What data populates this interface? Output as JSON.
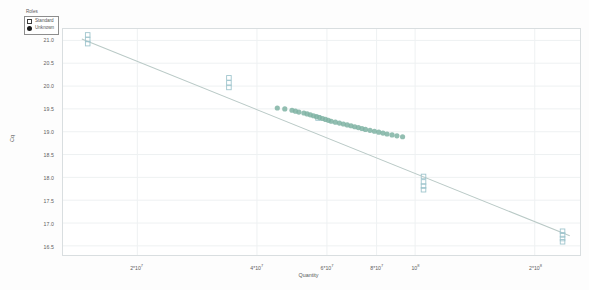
{
  "legend": {
    "title": "Roles",
    "entries": [
      {
        "label": "Standard",
        "marker": "open-square-marker",
        "color": "#ffffff"
      },
      {
        "label": "Unknown",
        "marker": "filled-circle-marker",
        "color": "#1a1a1a"
      }
    ]
  },
  "axes": {
    "x_title": "Quantity",
    "y_title": "Cq",
    "y_ticks": [
      "21.0",
      "20.5",
      "20.0",
      "19.5",
      "19.0",
      "18.5",
      "18.0",
      "17.5",
      "17.0",
      "16.5"
    ],
    "x_ticks": [
      {
        "mantissa": "2*10",
        "exponent": "7"
      },
      {
        "mantissa": "4*10",
        "exponent": "7"
      },
      {
        "mantissa": "6*10",
        "exponent": "7"
      },
      {
        "mantissa": "8*10",
        "exponent": "7"
      },
      {
        "mantissa": "10",
        "exponent": "8"
      },
      {
        "mantissa": "2*10",
        "exponent": "8"
      }
    ]
  },
  "colors": {
    "standard_marker": "#9fc5cd",
    "unknown_marker": "#7fb3a3",
    "fit_line": "#b9c9c6",
    "grid": "#eef1f2",
    "frame": "#d9dee0",
    "background": "#ffffff"
  },
  "chart_data": {
    "type": "scatter",
    "title": "",
    "xlabel": "Quantity",
    "ylabel": "Cq",
    "xscale": "log",
    "xlim": [
      13000000,
      260000000
    ],
    "ylim": [
      16.3,
      21.25
    ],
    "grid": true,
    "legend_position": "top-left",
    "ytick_values": [
      21.0,
      20.5,
      20.0,
      19.5,
      19.0,
      18.5,
      18.0,
      17.5,
      17.0,
      16.5
    ],
    "xtick_values": [
      20000000,
      40000000,
      60000000,
      80000000,
      100000000,
      200000000
    ],
    "fit_line": {
      "name": "Standard curve",
      "x": [
        14500000,
        245000000
      ],
      "y": [
        21.03,
        16.72
      ]
    },
    "series": [
      {
        "name": "Standard",
        "marker": "open-square",
        "color": "#9fc5cd",
        "points": [
          [
            15000000,
            21.12
          ],
          [
            15000000,
            21.02
          ],
          [
            15000000,
            20.93
          ],
          [
            34000000,
            20.18
          ],
          [
            34000000,
            20.07
          ],
          [
            34000000,
            19.97
          ],
          [
            57000000,
            19.3
          ],
          [
            105000000,
            18.02
          ],
          [
            105000000,
            17.9
          ],
          [
            105000000,
            17.81
          ],
          [
            105000000,
            17.73
          ],
          [
            235000000,
            16.82
          ],
          [
            235000000,
            16.74
          ],
          [
            235000000,
            16.66
          ],
          [
            235000000,
            16.59
          ]
        ]
      },
      {
        "name": "Unknown",
        "marker": "filled-circle",
        "color": "#7fb3a3",
        "points": [
          [
            45000000,
            19.52
          ],
          [
            47000000,
            19.5
          ],
          [
            49000000,
            19.47
          ],
          [
            50000000,
            19.45
          ],
          [
            51000000,
            19.43
          ],
          [
            52500000,
            19.41
          ],
          [
            53500000,
            19.39
          ],
          [
            54500000,
            19.37
          ],
          [
            55500000,
            19.35
          ],
          [
            56500000,
            19.33
          ],
          [
            57500000,
            19.31
          ],
          [
            58500000,
            19.29
          ],
          [
            59500000,
            19.27
          ],
          [
            60500000,
            19.25
          ],
          [
            61500000,
            19.23
          ],
          [
            63000000,
            19.21
          ],
          [
            64500000,
            19.19
          ],
          [
            66000000,
            19.17
          ],
          [
            67500000,
            19.15
          ],
          [
            69000000,
            19.13
          ],
          [
            70500000,
            19.11
          ],
          [
            72000000,
            19.09
          ],
          [
            73500000,
            19.07
          ],
          [
            75000000,
            19.05
          ],
          [
            77000000,
            19.03
          ],
          [
            79000000,
            19.01
          ],
          [
            81000000,
            18.99
          ],
          [
            83000000,
            18.97
          ],
          [
            85000000,
            18.95
          ],
          [
            87500000,
            18.93
          ],
          [
            90000000,
            18.91
          ],
          [
            93000000,
            18.89
          ]
        ]
      }
    ]
  }
}
